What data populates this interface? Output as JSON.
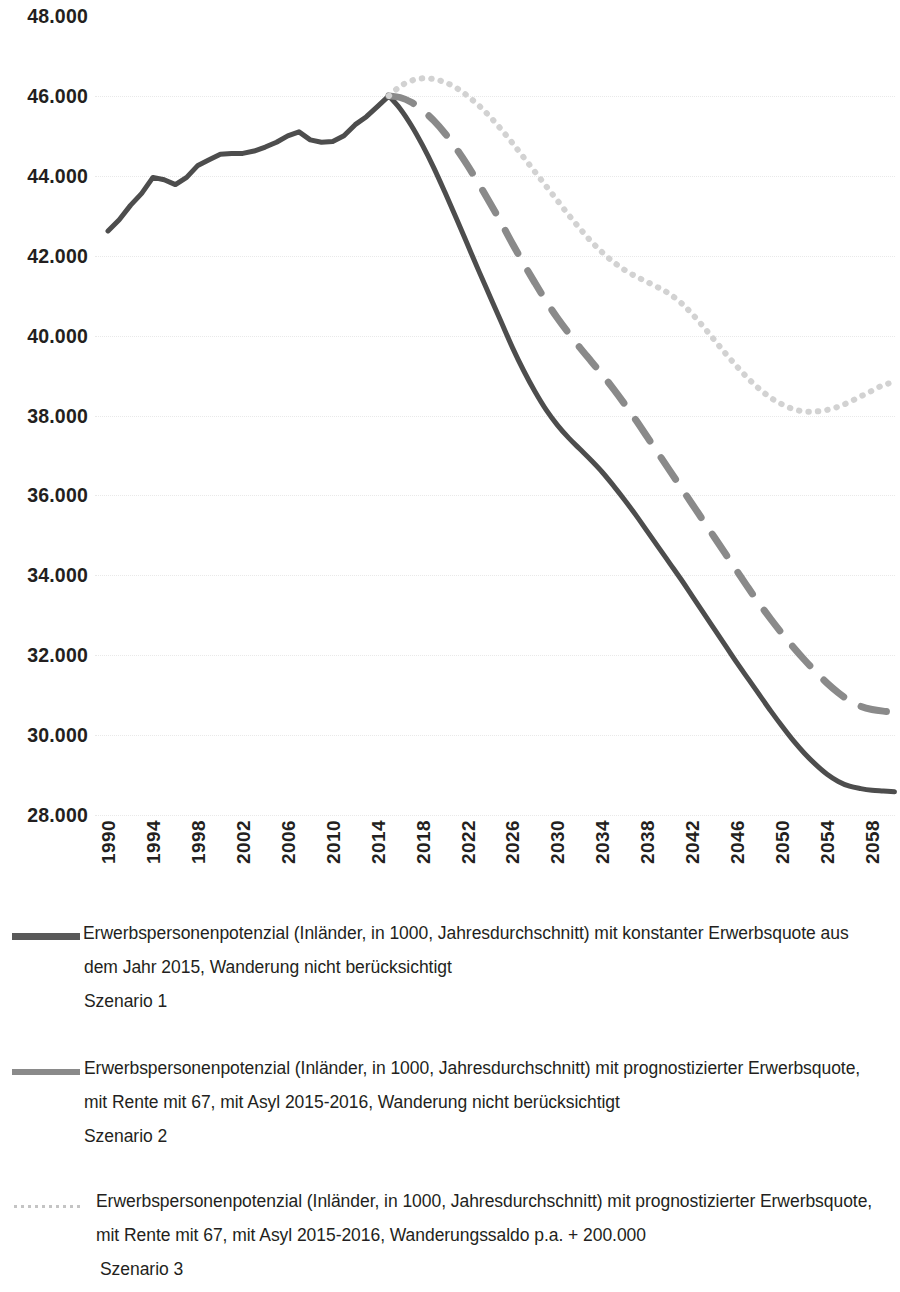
{
  "chart_data": {
    "type": "line",
    "title": "",
    "xlabel": "",
    "ylabel": "",
    "xlim": [
      1990,
      2060
    ],
    "ylim": [
      28000,
      48000
    ],
    "grid": true,
    "legend_position": "below",
    "y_ticks": [
      "48.000",
      "46.000",
      "44.000",
      "42.000",
      "40.000",
      "38.000",
      "36.000",
      "34.000",
      "32.000",
      "30.000",
      "28.000"
    ],
    "y_tick_values": [
      48000,
      46000,
      44000,
      42000,
      40000,
      38000,
      36000,
      34000,
      32000,
      30000,
      28000
    ],
    "x_ticks": [
      "1990",
      "1994",
      "1998",
      "2002",
      "2006",
      "2010",
      "2014",
      "2018",
      "2022",
      "2026",
      "2030",
      "2034",
      "2038",
      "2042",
      "2046",
      "2050",
      "2054",
      "2058"
    ],
    "x_tick_values": [
      1990,
      1994,
      1998,
      2002,
      2006,
      2010,
      2014,
      2018,
      2022,
      2026,
      2030,
      2034,
      2038,
      2042,
      2046,
      2050,
      2054,
      2058
    ],
    "colors": {
      "szenario1": "#4d4d4d",
      "szenario2": "#8a8a8a",
      "szenario3": "#d2d2d2"
    },
    "series": [
      {
        "name": "Szenario 1",
        "style": "solid",
        "color": "#4d4d4d",
        "x": [
          1990,
          1991,
          1992,
          1993,
          1994,
          1995,
          1996,
          1997,
          1998,
          1999,
          2000,
          2001,
          2002,
          2003,
          2004,
          2005,
          2006,
          2007,
          2008,
          2009,
          2010,
          2011,
          2012,
          2013,
          2014,
          2015,
          2016,
          2017,
          2018,
          2019,
          2020,
          2021,
          2022,
          2023,
          2024,
          2025,
          2026,
          2027,
          2028,
          2029,
          2030,
          2031,
          2032,
          2033,
          2034,
          2035,
          2036,
          2037,
          2038,
          2039,
          2040,
          2041,
          2042,
          2043,
          2044,
          2045,
          2046,
          2047,
          2048,
          2049,
          2050,
          2051,
          2052,
          2053,
          2054,
          2055,
          2056,
          2057,
          2058,
          2059,
          2060
        ],
        "y": [
          42620,
          42900,
          43260,
          43560,
          43960,
          43900,
          43780,
          43960,
          44260,
          44400,
          44540,
          44560,
          44560,
          44620,
          44720,
          44840,
          45000,
          45100,
          44900,
          44840,
          44860,
          45000,
          45280,
          45480,
          45740,
          46000,
          45680,
          45260,
          44760,
          44200,
          43580,
          42940,
          42280,
          41620,
          40980,
          40340,
          39700,
          39120,
          38600,
          38140,
          37760,
          37440,
          37160,
          36880,
          36580,
          36240,
          35880,
          35500,
          35100,
          34700,
          34300,
          33900,
          33480,
          33060,
          32640,
          32220,
          31800,
          31400,
          31000,
          30600,
          30220,
          29860,
          29540,
          29260,
          29020,
          28840,
          28720,
          28660,
          28620,
          28600,
          28580
        ]
      },
      {
        "name": "Szenario 2",
        "style": "dashed",
        "color": "#8a8a8a",
        "x": [
          2015,
          2016,
          2017,
          2018,
          2019,
          2020,
          2021,
          2022,
          2023,
          2024,
          2025,
          2026,
          2027,
          2028,
          2029,
          2030,
          2031,
          2032,
          2033,
          2034,
          2035,
          2036,
          2037,
          2038,
          2039,
          2040,
          2041,
          2042,
          2043,
          2044,
          2045,
          2046,
          2047,
          2048,
          2049,
          2050,
          2051,
          2052,
          2053,
          2054,
          2055,
          2056,
          2057,
          2058,
          2059,
          2060
        ],
        "y": [
          46000,
          45960,
          45840,
          45640,
          45380,
          45060,
          44680,
          44260,
          43800,
          43320,
          42820,
          42300,
          41800,
          41320,
          40860,
          40440,
          40060,
          39700,
          39360,
          39020,
          38660,
          38280,
          37880,
          37460,
          37040,
          36620,
          36200,
          35780,
          35360,
          34940,
          34520,
          34100,
          33680,
          33280,
          32900,
          32540,
          32200,
          31880,
          31580,
          31300,
          31060,
          30860,
          30720,
          30640,
          30600,
          30580
        ]
      },
      {
        "name": "Szenario 3",
        "style": "dotted",
        "color": "#d2d2d2",
        "x": [
          2015,
          2016,
          2017,
          2018,
          2019,
          2020,
          2021,
          2022,
          2023,
          2024,
          2025,
          2026,
          2027,
          2028,
          2029,
          2030,
          2031,
          2032,
          2033,
          2034,
          2035,
          2036,
          2037,
          2038,
          2039,
          2040,
          2041,
          2042,
          2043,
          2044,
          2045,
          2046,
          2047,
          2048,
          2049,
          2050,
          2051,
          2052,
          2053,
          2054,
          2055,
          2056,
          2057,
          2058,
          2059,
          2060
        ],
        "y": [
          46000,
          46240,
          46380,
          46440,
          46420,
          46340,
          46200,
          46000,
          45760,
          45480,
          45160,
          44820,
          44460,
          44100,
          43740,
          43380,
          43020,
          42680,
          42360,
          42080,
          41840,
          41640,
          41480,
          41340,
          41200,
          41040,
          40820,
          40540,
          40220,
          39880,
          39540,
          39220,
          38920,
          38660,
          38440,
          38280,
          38160,
          38100,
          38100,
          38140,
          38220,
          38340,
          38480,
          38620,
          38760,
          38840
        ]
      }
    ]
  },
  "legend": [
    {
      "swatch": "solid-line-swatch",
      "line1": "Erwerbspersonenpotenzial (Inländer, in 1000, Jahresdurchschnitt) mit konstanter Erwerbsquote aus",
      "line2": "dem Jahr 2015, Wanderung nicht berücksichtigt",
      "line3": "Szenario 1"
    },
    {
      "swatch": "dashed-line-swatch",
      "line1": "Erwerbspersonenpotenzial (Inländer, in 1000, Jahresdurchschnitt) mit prognostizierter Erwerbsquote,",
      "line2": "mit Rente mit 67, mit Asyl 2015-2016, Wanderung nicht berücksichtigt",
      "line3": "Szenario 2"
    },
    {
      "swatch": "dotted-line-swatch",
      "line1": "Erwerbspersonenpotenzial (Inländer, in 1000, Jahresdurchschnitt) mit prognostizierter Erwerbsquote,",
      "line2": "mit Rente mit 67, mit Asyl 2015-2016, Wanderungssaldo p.a. + 200.000",
      "line3": "Szenario 3"
    }
  ]
}
